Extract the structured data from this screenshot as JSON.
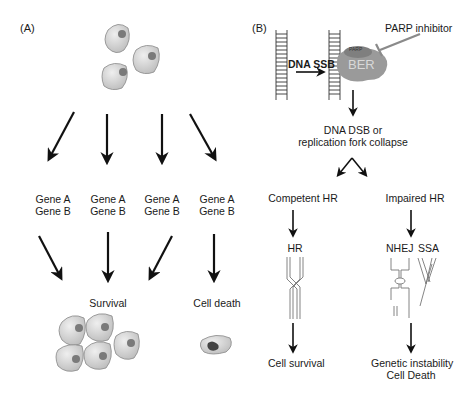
{
  "panel_a": {
    "label": "(A)",
    "genotypes": [
      {
        "line1": "Gene A",
        "line2": "Gene B"
      },
      {
        "line1": "Gene A",
        "line2": "Gene B"
      },
      {
        "line1": "Gene A",
        "line2": "Gene B"
      },
      {
        "line1": "Gene A",
        "line2": "Gene B"
      }
    ],
    "outcomes": {
      "survival": "Survival",
      "death": "Cell death"
    }
  },
  "panel_b": {
    "label": "(B)",
    "inhibitor": "PARP inhibitor",
    "lesion": "DNA SSB",
    "parp": "PARP",
    "ber": "BER",
    "consequence_line1": "DNA DSB or",
    "consequence_line2": "replication fork collapse",
    "branch_left": "Competent HR",
    "branch_right": "Impaired HR",
    "pathway_left": "HR",
    "pathway_right_1": "NHEJ",
    "pathway_right_2": "SSA",
    "outcome_left": "Cell survival",
    "outcome_right_line1": "Genetic instability",
    "outcome_right_line2": "Cell Death"
  },
  "colors": {
    "cell_fill": "#d4d4d4",
    "nucleus": "#7a7a7a",
    "ber_fill": "#9a9a9a",
    "parp_fill": "#7f7f7f",
    "arrow": "#111111"
  }
}
